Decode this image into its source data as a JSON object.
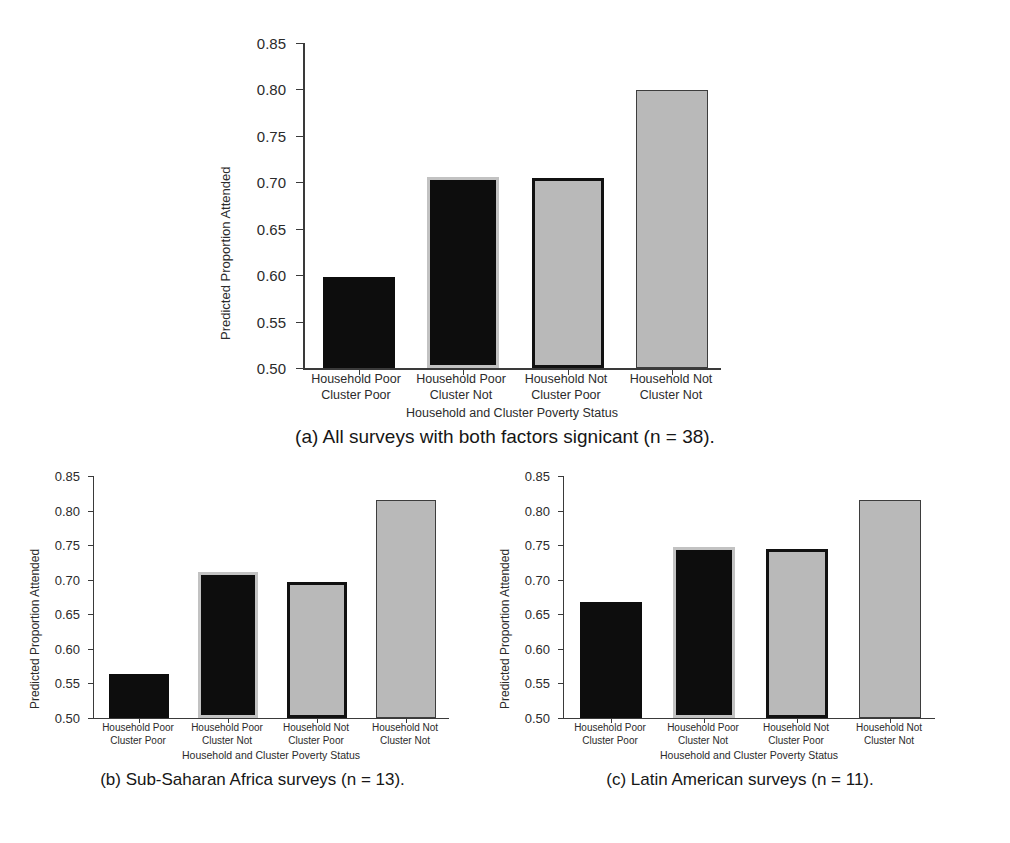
{
  "figure": {
    "axis_y_label": "Predicted Proportion Attended",
    "axis_x_label": "Household and Cluster Poverty Status",
    "y_ticks": [
      "0.85",
      "0.80",
      "0.75",
      "0.70",
      "0.65",
      "0.60",
      "0.55",
      "0.50"
    ],
    "categories": [
      "Household Poor\nCluster Poor",
      "Household Poor\nCluster Not",
      "Household Not\nCluster Poor",
      "Household Not\nCluster Not"
    ],
    "colors": {
      "black_fill": "#0d0d0d",
      "gray_fill": "#b9b9b9",
      "gray_outline": "#c2c2c2",
      "black_outline": "#111111",
      "axis": "#3a3a3a"
    }
  },
  "panels": {
    "a": {
      "caption": "(a) All surveys with both factors signicant (n = 38)."
    },
    "b": {
      "caption": "(b) Sub-Saharan Africa surveys (n = 13)."
    },
    "c": {
      "caption": "(c) Latin American surveys (n = 11)."
    }
  },
  "chart_data": [
    {
      "type": "bar",
      "title": "(a) All surveys with both factors signicant (n = 38).",
      "panel": "a",
      "n": 38,
      "xlabel": "Household and Cluster Poverty Status",
      "ylabel": "Predicted Proportion Attended",
      "ylim": [
        0.5,
        0.85
      ],
      "yticks": [
        0.5,
        0.55,
        0.6,
        0.65,
        0.7,
        0.75,
        0.8,
        0.85
      ],
      "grid": false,
      "legend": "none",
      "categories": [
        "Household Poor / Cluster Poor",
        "Household Poor / Cluster Not",
        "Household Not / Cluster Poor",
        "Household Not / Cluster Not"
      ],
      "values": [
        0.598,
        0.706,
        0.705,
        0.799
      ],
      "bar_styles": [
        "black-solid",
        "black-with-gray-outline",
        "gray-with-black-outline",
        "gray-with-thin-outline"
      ]
    },
    {
      "type": "bar",
      "title": "(b) Sub-Saharan Africa surveys (n = 13).",
      "panel": "b",
      "n": 13,
      "xlabel": "Household and Cluster Poverty Status",
      "ylabel": "Predicted Proportion Attended",
      "ylim": [
        0.5,
        0.85
      ],
      "yticks": [
        0.5,
        0.55,
        0.6,
        0.65,
        0.7,
        0.75,
        0.8,
        0.85
      ],
      "grid": false,
      "legend": "none",
      "categories": [
        "Household Poor / Cluster Poor",
        "Household Poor / Cluster Not",
        "Household Not / Cluster Poor",
        "Household Not / Cluster Not"
      ],
      "values": [
        0.564,
        0.711,
        0.696,
        0.815
      ],
      "bar_styles": [
        "black-solid",
        "black-with-gray-outline",
        "gray-with-black-outline",
        "gray-with-thin-outline"
      ]
    },
    {
      "type": "bar",
      "title": "(c) Latin American surveys (n = 11).",
      "panel": "c",
      "n": 11,
      "xlabel": "Household and Cluster Poverty Status",
      "ylabel": "Predicted Proportion Attended",
      "ylim": [
        0.5,
        0.85
      ],
      "yticks": [
        0.5,
        0.55,
        0.6,
        0.65,
        0.7,
        0.75,
        0.8,
        0.85
      ],
      "grid": false,
      "legend": "none",
      "categories": [
        "Household Poor / Cluster Poor",
        "Household Poor / Cluster Not",
        "Household Not / Cluster Poor",
        "Household Not / Cluster Not"
      ],
      "values": [
        0.668,
        0.748,
        0.744,
        0.815
      ],
      "bar_styles": [
        "black-solid",
        "black-with-gray-outline",
        "gray-with-black-outline",
        "gray-with-thin-outline"
      ]
    }
  ]
}
